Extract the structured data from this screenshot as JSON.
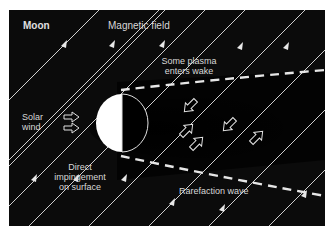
{
  "diagram": {
    "title": "Moon",
    "labels": {
      "magnetic_field": "Magnetic field",
      "plasma_line1": "Some plasma",
      "plasma_line2": "enters wake",
      "solar_line1": "Solar",
      "solar_line2": "wind",
      "direct_line1": "Direct",
      "direct_line2": "impingement",
      "direct_line3": "on surface",
      "rarefaction": "Rarefaction wave"
    },
    "colors": {
      "background": "#0b0b0b",
      "lines": "#d0d0d0",
      "moon_day": "#ffffff",
      "moon_night": "#000000",
      "text": "#d8d8d8"
    }
  }
}
